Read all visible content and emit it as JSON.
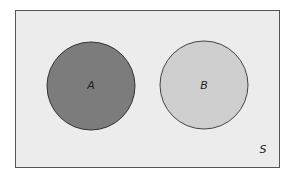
{
  "diagram": {
    "type": "venn",
    "universe": {
      "label": "S",
      "fill": "#ececec",
      "stroke": "#555555"
    },
    "sets": [
      {
        "label": "A",
        "fill": "#7c7c7c",
        "stroke": "#333333"
      },
      {
        "label": "B",
        "fill": "#cfcfcf",
        "stroke": "#444444"
      }
    ],
    "relationship": "disjoint"
  }
}
